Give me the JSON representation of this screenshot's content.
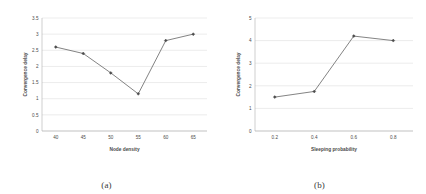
{
  "figure": {
    "panels": [
      {
        "caption": "(a)",
        "chart_data": {
          "type": "line",
          "title": "",
          "xlabel": "Node density",
          "ylabel": "Convergence delay",
          "x": [
            40,
            45,
            50,
            55,
            60,
            65
          ],
          "xticklabels": [
            "40",
            "45",
            "50",
            "55",
            "60",
            "65"
          ],
          "yticklabels": [
            "0",
            "0.5",
            "1",
            "1.5",
            "2",
            "2.5",
            "3",
            "3.5"
          ],
          "yticks": [
            0,
            0.5,
            1,
            1.5,
            2,
            2.5,
            3,
            3.5
          ],
          "values": [
            2.6,
            2.4,
            1.8,
            1.15,
            2.8,
            3.0
          ],
          "xlim": [
            37.5,
            67.5
          ],
          "ylim": [
            0,
            3.5
          ],
          "grid": true,
          "legend": null,
          "marker": "diamond",
          "line_color": "#6d6d6d"
        }
      },
      {
        "caption": "(b)",
        "chart_data": {
          "type": "line",
          "title": "",
          "xlabel": "Sleeping probability",
          "ylabel": "Convergence delay",
          "x": [
            0.2,
            0.4,
            0.6,
            0.8
          ],
          "xticklabels": [
            "0.2",
            "0.4",
            "0.6",
            "0.8"
          ],
          "yticklabels": [
            "0",
            "1",
            "2",
            "3",
            "4",
            "5"
          ],
          "yticks": [
            0,
            1,
            2,
            3,
            4,
            5
          ],
          "values": [
            1.5,
            1.75,
            4.2,
            4.0
          ],
          "xlim": [
            0.1,
            0.9
          ],
          "ylim": [
            0,
            5
          ],
          "grid": true,
          "legend": null,
          "marker": "diamond",
          "line_color": "#6d6d6d"
        }
      }
    ]
  }
}
